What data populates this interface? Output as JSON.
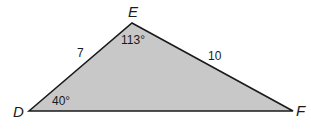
{
  "figure": {
    "type": "triangle",
    "fill_color": "#c8c8c8",
    "stroke_color": "#1a1a1a",
    "vertices": [
      {
        "name": "D",
        "label": "D"
      },
      {
        "name": "E",
        "label": "E"
      },
      {
        "name": "F",
        "label": "F"
      }
    ],
    "sides": [
      {
        "between": "DE",
        "label": "7"
      },
      {
        "between": "EF",
        "label": "10"
      }
    ],
    "angles": [
      {
        "at": "E",
        "label": "113°"
      },
      {
        "at": "D",
        "label": "40°"
      }
    ]
  }
}
